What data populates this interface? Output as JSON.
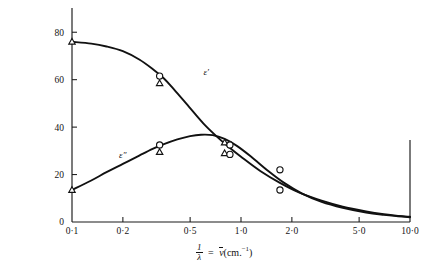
{
  "figure": {
    "background_color": "#ffffff",
    "ink_color": "#111111"
  },
  "axis_caption": {
    "numerator": "1",
    "denominator": "λ",
    "equals": "=",
    "symbol": "ν",
    "units_open": "(cm.",
    "units_exponent": "−1",
    "units_close": ")",
    "full_text": "1/λ = ν̄ (cm.⁻¹)"
  },
  "chart_data": {
    "type": "line",
    "title": "",
    "subtitle": "",
    "xlabel": "1/λ = ν̄(cm.⁻¹)",
    "ylabel": "",
    "xscale": "log",
    "yscale": "linear",
    "xlim": [
      0.1,
      10.0
    ],
    "ylim": [
      0,
      86
    ],
    "grid": false,
    "legend_position": "inline-curve-labels",
    "x_ticks": [
      {
        "value": 0.1,
        "label": "0·1"
      },
      {
        "value": 0.2,
        "label": "0·2"
      },
      {
        "value": 0.5,
        "label": "0·5"
      },
      {
        "value": 1.0,
        "label": "1·0"
      },
      {
        "value": 2.0,
        "label": "2·0"
      },
      {
        "value": 5.0,
        "label": "5·0"
      },
      {
        "value": 10.0,
        "label": "10·0"
      }
    ],
    "y_ticks": [
      {
        "value": 0,
        "label": "0"
      },
      {
        "value": 20,
        "label": "20"
      },
      {
        "value": 40,
        "label": "40"
      },
      {
        "value": 60,
        "label": "60"
      },
      {
        "value": 80,
        "label": "80"
      }
    ],
    "categories": [],
    "series": [
      {
        "name": "ε′",
        "label": "ε′",
        "label_x": 0.6,
        "label_y": 62,
        "marker": "circle-and-triangle",
        "color": "#111111",
        "curve_points": [
          {
            "x": 0.1,
            "y": 76.0
          },
          {
            "x": 0.13,
            "y": 75.2
          },
          {
            "x": 0.16,
            "y": 74.0
          },
          {
            "x": 0.2,
            "y": 72.0
          },
          {
            "x": 0.25,
            "y": 68.5
          },
          {
            "x": 0.3,
            "y": 64.5
          },
          {
            "x": 0.35,
            "y": 60.5
          },
          {
            "x": 0.4,
            "y": 56.0
          },
          {
            "x": 0.5,
            "y": 48.0
          },
          {
            "x": 0.6,
            "y": 41.5
          },
          {
            "x": 0.72,
            "y": 36.0
          },
          {
            "x": 0.85,
            "y": 31.5
          },
          {
            "x": 1.0,
            "y": 27.5
          },
          {
            "x": 1.3,
            "y": 21.5
          },
          {
            "x": 1.7,
            "y": 16.5
          },
          {
            "x": 2.2,
            "y": 12.5
          },
          {
            "x": 3.0,
            "y": 9.0
          },
          {
            "x": 4.0,
            "y": 6.5
          },
          {
            "x": 5.5,
            "y": 4.5
          },
          {
            "x": 7.0,
            "y": 3.3
          },
          {
            "x": 8.5,
            "y": 2.6
          },
          {
            "x": 10.0,
            "y": 2.2
          }
        ],
        "points": [
          {
            "x": 0.1,
            "y": 76.0,
            "markers": [
              "triangle"
            ]
          },
          {
            "x": 0.33,
            "y": 61.5,
            "markers": [
              "circle"
            ]
          },
          {
            "x": 0.33,
            "y": 58.5,
            "markers": [
              "triangle"
            ]
          },
          {
            "x": 0.8,
            "y": 33.5,
            "markers": [
              "triangle"
            ]
          },
          {
            "x": 0.86,
            "y": 32.5,
            "markers": [
              "circle"
            ]
          },
          {
            "x": 1.7,
            "y": 22.0,
            "markers": [
              "circle"
            ]
          }
        ]
      },
      {
        "name": "ε″",
        "label": "ε″",
        "label_x": 0.19,
        "label_y": 27,
        "marker": "circle-and-triangle",
        "color": "#111111",
        "curve_points": [
          {
            "x": 0.1,
            "y": 13.5
          },
          {
            "x": 0.13,
            "y": 17.5
          },
          {
            "x": 0.16,
            "y": 21.0
          },
          {
            "x": 0.2,
            "y": 24.5
          },
          {
            "x": 0.25,
            "y": 28.0
          },
          {
            "x": 0.3,
            "y": 30.8
          },
          {
            "x": 0.35,
            "y": 32.8
          },
          {
            "x": 0.42,
            "y": 34.8
          },
          {
            "x": 0.5,
            "y": 36.2
          },
          {
            "x": 0.58,
            "y": 36.8
          },
          {
            "x": 0.68,
            "y": 36.6
          },
          {
            "x": 0.8,
            "y": 35.0
          },
          {
            "x": 0.95,
            "y": 32.0
          },
          {
            "x": 1.15,
            "y": 27.5
          },
          {
            "x": 1.45,
            "y": 21.5
          },
          {
            "x": 1.8,
            "y": 16.5
          },
          {
            "x": 2.3,
            "y": 12.0
          },
          {
            "x": 3.0,
            "y": 8.5
          },
          {
            "x": 4.0,
            "y": 6.0
          },
          {
            "x": 5.5,
            "y": 4.0
          },
          {
            "x": 7.0,
            "y": 3.0
          },
          {
            "x": 8.5,
            "y": 2.4
          },
          {
            "x": 10.0,
            "y": 2.0
          }
        ],
        "points": [
          {
            "x": 0.1,
            "y": 13.5,
            "markers": [
              "triangle"
            ]
          },
          {
            "x": 0.33,
            "y": 32.5,
            "markers": [
              "circle"
            ]
          },
          {
            "x": 0.33,
            "y": 29.5,
            "markers": [
              "triangle"
            ]
          },
          {
            "x": 0.8,
            "y": 29.0,
            "markers": [
              "triangle"
            ]
          },
          {
            "x": 0.86,
            "y": 28.5,
            "markers": [
              "circle"
            ]
          },
          {
            "x": 1.7,
            "y": 13.5,
            "markers": [
              "circle"
            ]
          }
        ]
      }
    ]
  }
}
